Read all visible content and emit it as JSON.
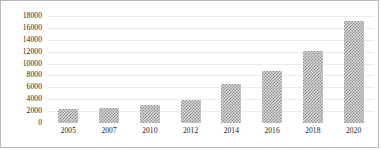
{
  "chart_data": {
    "type": "bar",
    "title": "",
    "subtitle": "",
    "xlabel": "",
    "ylabel": "",
    "categories": [
      "2005",
      "2007",
      "2010",
      "2012",
      "2014",
      "2016",
      "2018",
      "2020"
    ],
    "values": [
      2300,
      2500,
      3000,
      3900,
      6500,
      8800,
      12100,
      17100
    ],
    "series": [
      {
        "name": "",
        "values": [
          2300,
          2500,
          3000,
          3900,
          6500,
          8800,
          12100,
          17100
        ]
      }
    ],
    "ylim": [
      0,
      18000
    ],
    "ytick_labels": [
      "0",
      "2000",
      "4000",
      "6000",
      "8000",
      "10000",
      "12000",
      "14000",
      "16000",
      "18000"
    ],
    "ytick_values": [
      0,
      2000,
      4000,
      6000,
      8000,
      10000,
      12000,
      14000,
      16000,
      18000
    ],
    "xtick_labels": [
      "2005",
      "2007",
      "2010",
      "2012",
      "2014",
      "2016",
      "2018",
      "2020"
    ],
    "grid": true,
    "legend": false,
    "legend_position": "none",
    "annotations": [],
    "bar_color": "#8c8c8c",
    "bar_fill": "checkered-hatch",
    "grid_color": "#ececec",
    "border_color": "#b9b9b9",
    "text_color": "#1a1a1a"
  }
}
